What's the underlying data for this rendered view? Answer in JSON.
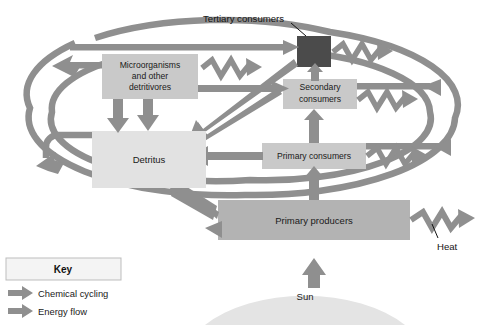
{
  "diagram": {
    "colors": {
      "arrow_gray": "#8f8f8f",
      "arrow_gray_dark": "#848484",
      "box_mid_gray": "#b3b3b3",
      "box_light_gray": "#c9c9c9",
      "box_pale_gray": "#e2e2e2",
      "box_dark_gray": "#4b4b4b",
      "sun_gray": "#e4e4e4",
      "text_dark": "#1a1a1a",
      "key_border": "#bdbdbd",
      "key_fill": "#f4f4f4"
    },
    "nodes": {
      "tertiary_consumers": {
        "label": "Tertiary consumers",
        "style": "callout",
        "box_fill": "box_dark_gray"
      },
      "microorganisms": {
        "line1": "Microorganisms",
        "line2": "and other",
        "line3": "detritivores",
        "box_fill": "box_light_gray"
      },
      "secondary_consumers": {
        "line1": "Secondary",
        "line2": "consumers",
        "box_fill": "box_light_gray"
      },
      "primary_consumers": {
        "label": "Primary consumers",
        "box_fill": "box_light_gray"
      },
      "detritus": {
        "label": "Detritus",
        "box_fill": "box_pale_gray"
      },
      "primary_producers": {
        "label": "Primary producers",
        "box_fill": "box_mid_gray"
      },
      "sun": {
        "label": "Sun",
        "box_fill": "sun_gray"
      },
      "heat": {
        "label": "Heat",
        "style": "callout"
      }
    },
    "key": {
      "title": "Key",
      "entries": [
        {
          "label": "Chemical cycling",
          "icon": "block-arrow-icon"
        },
        {
          "label": "Energy flow",
          "icon": "block-arrow-icon"
        }
      ]
    }
  }
}
